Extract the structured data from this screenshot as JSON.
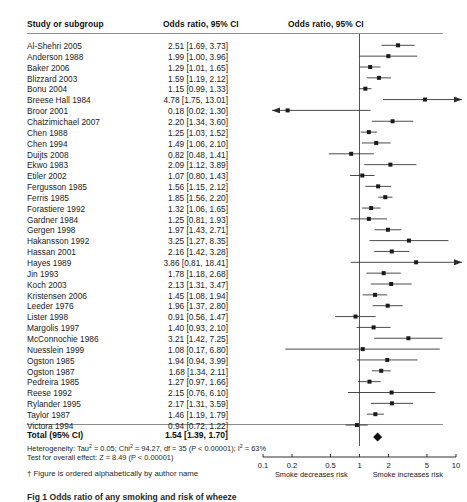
{
  "header": {
    "col_study": "Study or subgroup",
    "col_or": "Odds ratio, 95% CI",
    "col_plot": "Odds ratio, 95% CI"
  },
  "chart_data": {
    "type": "forest",
    "title": "Odds ratio, 95% CI",
    "xlabel": "",
    "ylabel": "",
    "xscale": "log",
    "xlim": [
      0.1,
      10
    ],
    "ticks": [
      0.1,
      0.2,
      0.5,
      1,
      2,
      5,
      10
    ],
    "tick_labels": [
      "0.1",
      "0.2",
      "0.5",
      "1",
      "2",
      "5",
      "10"
    ],
    "null_line": 1,
    "left_direction_label": "Smoke decreases risk",
    "right_direction_label": "Smoke increases risk",
    "effect_measure": "Odds ratio",
    "ci_level": "95% CI",
    "studies": [
      {
        "label": "Al-Shehri 2005",
        "or": 2.51,
        "lo": 1.69,
        "hi": 3.73,
        "text": "2.51 [1.69, 3.73]"
      },
      {
        "label": "Anderson 1988",
        "or": 1.99,
        "lo": 1.0,
        "hi": 3.96,
        "text": "1.99 [1.00, 3.96]"
      },
      {
        "label": "Baker 2006",
        "or": 1.29,
        "lo": 1.01,
        "hi": 1.65,
        "text": "1.29 [1.01, 1.65]"
      },
      {
        "label": "Blizzard 2003",
        "or": 1.59,
        "lo": 1.19,
        "hi": 2.12,
        "text": "1.59 [1.19, 2.12]"
      },
      {
        "label": "Bonu 2004",
        "or": 1.15,
        "lo": 0.99,
        "hi": 1.33,
        "text": "1.15 [0.99, 1.33]"
      },
      {
        "label": "Breese Hall 1984",
        "or": 4.78,
        "lo": 1.75,
        "hi": 13.01,
        "text": "4.78 [1.75, 13.01]"
      },
      {
        "label": "Broor 2001",
        "or": 0.18,
        "lo": 0.02,
        "hi": 1.3,
        "text": "0.18 [0.02, 1.30]"
      },
      {
        "label": "Chatzimichael 2007",
        "or": 2.2,
        "lo": 1.34,
        "hi": 3.6,
        "text": "2.20 [1.34, 3.60]"
      },
      {
        "label": "Chen 1988",
        "or": 1.25,
        "lo": 1.03,
        "hi": 1.52,
        "text": "1.25 [1.03, 1.52]"
      },
      {
        "label": "Chen 1994",
        "or": 1.49,
        "lo": 1.06,
        "hi": 2.1,
        "text": "1.49 [1.06, 2.10]"
      },
      {
        "label": "Duijts 2008",
        "or": 0.82,
        "lo": 0.48,
        "hi": 1.41,
        "text": "0.82 [0.48, 1.41]"
      },
      {
        "label": "Ekwo 1983",
        "or": 2.09,
        "lo": 1.12,
        "hi": 3.89,
        "text": "2.09 [1.12, 3.89]"
      },
      {
        "label": "Etiler 2002",
        "or": 1.07,
        "lo": 0.8,
        "hi": 1.43,
        "text": "1.07 [0.80, 1.43]"
      },
      {
        "label": "Fergusson 1985",
        "or": 1.56,
        "lo": 1.15,
        "hi": 2.12,
        "text": "1.56 [1.15, 2.12]"
      },
      {
        "label": "Ferris 1985",
        "or": 1.85,
        "lo": 1.56,
        "hi": 2.2,
        "text": "1.85 [1.56, 2.20]"
      },
      {
        "label": "Forastiere 1992",
        "or": 1.32,
        "lo": 1.06,
        "hi": 1.65,
        "text": "1.32 [1.06, 1.65]"
      },
      {
        "label": "Gardner 1984",
        "or": 1.25,
        "lo": 0.81,
        "hi": 1.93,
        "text": "1.25 [0.81, 1.93]"
      },
      {
        "label": "Gergen 1998",
        "or": 1.97,
        "lo": 1.43,
        "hi": 2.71,
        "text": "1.97 [1.43, 2.71]"
      },
      {
        "label": "Hakansson 1992",
        "or": 3.25,
        "lo": 1.27,
        "hi": 8.35,
        "text": "3.25 [1.27, 8.35]"
      },
      {
        "label": "Hassan 2001",
        "or": 2.16,
        "lo": 1.42,
        "hi": 3.28,
        "text": "2.16 [1.42, 3.28]"
      },
      {
        "label": "Hayes 1989",
        "or": 3.86,
        "lo": 0.81,
        "hi": 18.41,
        "text": "3.86 [0.81, 18.41]"
      },
      {
        "label": "Jin 1993",
        "or": 1.78,
        "lo": 1.18,
        "hi": 2.68,
        "text": "1.78 [1.18, 2.68]"
      },
      {
        "label": "Koch 2003",
        "or": 2.13,
        "lo": 1.31,
        "hi": 3.47,
        "text": "2.13 [1.31, 3.47]"
      },
      {
        "label": "Kristensen 2006",
        "or": 1.45,
        "lo": 1.08,
        "hi": 1.94,
        "text": "1.45 [1.08, 1.94]"
      },
      {
        "label": "Leeder 1976",
        "or": 1.96,
        "lo": 1.37,
        "hi": 2.8,
        "text": "1.96 [1.37, 2.80]"
      },
      {
        "label": "Lister 1998",
        "or": 0.91,
        "lo": 0.56,
        "hi": 1.47,
        "text": "0.91 [0.56, 1.47]"
      },
      {
        "label": "Margolis 1997",
        "or": 1.4,
        "lo": 0.93,
        "hi": 2.1,
        "text": "1.40 [0.93, 2.10]"
      },
      {
        "label": "McConnochie 1986",
        "or": 3.21,
        "lo": 1.42,
        "hi": 7.25,
        "text": "3.21 [1.42, 7.25]"
      },
      {
        "label": "Nuesslein 1999",
        "or": 1.08,
        "lo": 0.17,
        "hi": 6.8,
        "text": "1.08 [0.17, 6.80]"
      },
      {
        "label": "Ogston 1985",
        "or": 1.94,
        "lo": 0.94,
        "hi": 3.99,
        "text": "1.94 [0.94, 3.99]"
      },
      {
        "label": "Ogston 1987",
        "or": 1.68,
        "lo": 1.34,
        "hi": 2.11,
        "text": "1.68 [1.34, 2.11]"
      },
      {
        "label": "Pedreira 1985",
        "or": 1.27,
        "lo": 0.97,
        "hi": 1.66,
        "text": "1.27  [0.97, 1.66]"
      },
      {
        "label": "Reese 1992",
        "or": 2.15,
        "lo": 0.76,
        "hi": 6.1,
        "text": "2.15 [0.76, 6.10]"
      },
      {
        "label": "Rylander 1995",
        "or": 2.17,
        "lo": 1.31,
        "hi": 3.59,
        "text": "2.17 [1.31, 3.59]"
      },
      {
        "label": "Taylor 1987",
        "or": 1.46,
        "lo": 1.19,
        "hi": 1.79,
        "text": "1.46 [1.19, 1.79]"
      },
      {
        "label": "Victora 1994",
        "or": 0.94,
        "lo": 0.72,
        "hi": 1.22,
        "text": "0.94 [0.72, 1.22]"
      }
    ],
    "total": {
      "label": "Total (95% CI)",
      "or": 1.54,
      "lo": 1.39,
      "hi": 1.7,
      "text": "1.54 [1.39, 1.70]"
    }
  },
  "stats": {
    "heterogeneity_prefix": "Heterogeneity: Tau",
    "heterogeneity_mid": " = 0.05; Chi",
    "heterogeneity_rest": " = 94.27, df = 35 (P < 0.00001); I",
    "heterogeneity_end": " = 63%",
    "overall_effect": "Test for overall effect: Z = 8.49 (P < 0.00001)"
  },
  "footnote": "† Figure is ordered alphabetically by author name",
  "caption": "Fig 1 Odds ratio of any smoking and risk of wheeze",
  "colors": {
    "marker": "#1a1a1a",
    "line": "#2b2b2b",
    "diamond": "#111111",
    "rule": "#8b8b8b",
    "null_line": "#555555"
  }
}
